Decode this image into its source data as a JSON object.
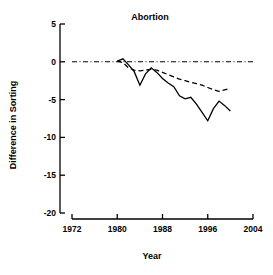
{
  "chart_data": {
    "type": "line",
    "title": "Abortion",
    "xlabel": "Year",
    "ylabel": "Difference in Sorting",
    "xlim": [
      1972,
      2004
    ],
    "ylim": [
      -20,
      5
    ],
    "xticks": [
      1972,
      1980,
      1988,
      1996,
      2004
    ],
    "xticklabels": [
      "1972",
      "1980",
      "1988",
      "1996",
      "2004"
    ],
    "yticks": [
      5,
      0,
      -5,
      -10,
      -15,
      -20
    ],
    "yticklabels": [
      "5",
      "0",
      "-5",
      "-10",
      "-15",
      "-20"
    ],
    "grid": false,
    "legend": "none",
    "reference_lines": [
      {
        "name": "zero-line",
        "orientation": "horizontal",
        "y": 0,
        "style": "dash-dot",
        "x_start": 1972,
        "x_end": 2004
      }
    ],
    "x": [
      1980,
      1981,
      1982,
      1983,
      1984,
      1985,
      1986,
      1987,
      1988,
      1989,
      1990,
      1991,
      1992,
      1993,
      1994,
      1995,
      1996,
      1997,
      1998,
      1999,
      2000
    ],
    "series": [
      {
        "name": "observed",
        "style": "solid",
        "values": [
          0.1,
          0.4,
          -0.4,
          -1.3,
          -3.1,
          -1.6,
          -0.8,
          -1.4,
          -2.2,
          -2.8,
          -3.3,
          -4.5,
          -4.9,
          -4.7,
          -5.6,
          -6.7,
          -7.8,
          -6.2,
          -5.2,
          -5.8,
          -6.5
        ]
      },
      {
        "name": "smoothed",
        "style": "dashed",
        "values": [
          0.1,
          -0.1,
          -0.8,
          -1.1,
          -1.2,
          -1.1,
          -1.0,
          -1.1,
          -1.4,
          -1.7,
          -2.0,
          -2.3,
          -2.5,
          -2.7,
          -2.9,
          -3.1,
          -3.4,
          -3.7,
          -3.9,
          -3.7,
          -3.5
        ]
      }
    ]
  }
}
